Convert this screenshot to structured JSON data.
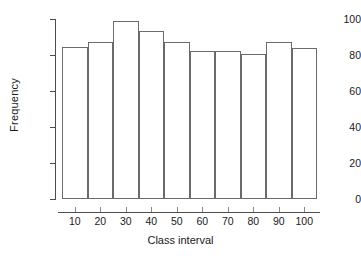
{
  "chart_data": {
    "type": "bar",
    "title": "",
    "xlabel": "Class interval",
    "ylabel": "Frequency",
    "categories": [
      "10",
      "20",
      "30",
      "40",
      "50",
      "60",
      "70",
      "80",
      "90",
      "100"
    ],
    "values": [
      84.5,
      87.5,
      99,
      93.5,
      87,
      82.5,
      82.5,
      80.5,
      87,
      84
    ],
    "ylim": [
      0,
      100
    ],
    "yticks": [
      0,
      20,
      40,
      60,
      80,
      100
    ],
    "ytick_labels": [
      "0",
      "20",
      "40",
      "60",
      "80",
      "100"
    ],
    "grid": false,
    "legend": null,
    "bar_fill": "#ffffff",
    "bar_stroke": "#6b6b6b",
    "axis_color": "#4d4d4d",
    "text_color": "#1a1a1a",
    "background": "#ffffff"
  }
}
